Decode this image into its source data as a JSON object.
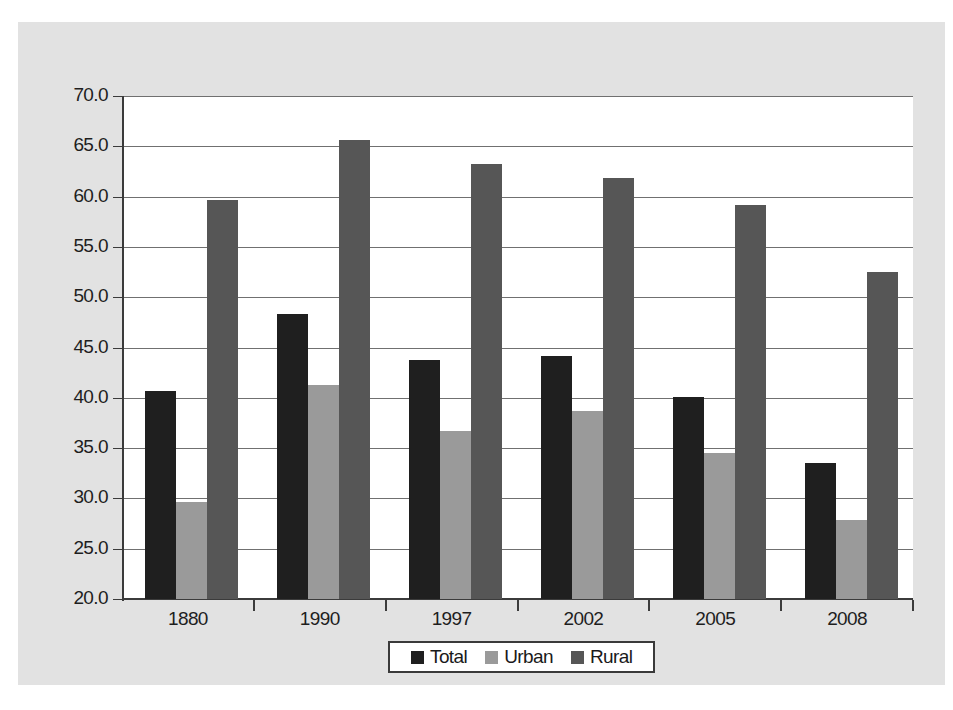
{
  "chart_data": {
    "type": "bar",
    "title": "",
    "subtitle": "",
    "xlabel": "",
    "ylabel": "",
    "categories": [
      "1880",
      "1990",
      "1997",
      "2002",
      "2005",
      "2008"
    ],
    "series": [
      {
        "name": "Total",
        "color": "#1f1f1f",
        "values": [
          40.7,
          48.3,
          43.8,
          44.2,
          40.1,
          33.5
        ]
      },
      {
        "name": "Urban",
        "color": "#9a9a9a",
        "values": [
          29.6,
          41.3,
          36.7,
          38.7,
          34.5,
          27.9
        ]
      },
      {
        "name": "Rural",
        "color": "#565656",
        "values": [
          59.7,
          65.6,
          63.2,
          61.9,
          59.2,
          52.5
        ]
      }
    ],
    "ylim": [
      20.0,
      70.0
    ],
    "ytick_labels": [
      "70.0",
      "65.0",
      "60.0",
      "55.0",
      "50.0",
      "45.0",
      "40.0",
      "35.0",
      "30.0",
      "25.0",
      "20.0"
    ],
    "ytick_values": [
      70.0,
      65.0,
      60.0,
      55.0,
      50.0,
      45.0,
      40.0,
      35.0,
      30.0,
      25.0,
      20.0
    ],
    "grid": true,
    "legend_position": "bottom-center",
    "legend_entries": [
      "Total",
      "Urban",
      "Rural"
    ]
  },
  "colors": {
    "panel_background": "#e2e2e2",
    "plot_background": "#ffffff",
    "gridline": "#707070",
    "axis": "#3b3b3b",
    "text": "#1e1e1e",
    "total": "#1f1f1f",
    "urban": "#9a9a9a",
    "rural": "#565656"
  }
}
